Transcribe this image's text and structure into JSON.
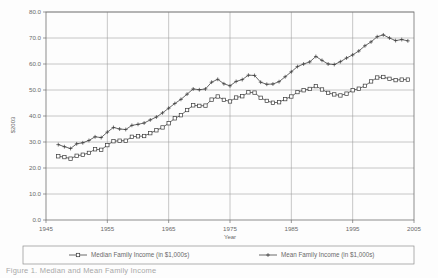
{
  "figure": {
    "name": "family-income-line-chart",
    "caption_fragment": "Figure 1. Median and Mean Family Income"
  },
  "axes": {
    "y_title": "$2003",
    "x_title": "Year",
    "y_ticks": [
      "0.0",
      "10.0",
      "20.0",
      "30.0",
      "40.0",
      "50.0",
      "60.0",
      "70.0",
      "80.0"
    ],
    "x_ticks": [
      "1945",
      "1955",
      "1965",
      "1975",
      "1985",
      "1995",
      "2005"
    ]
  },
  "legend": {
    "position": "bottom",
    "entries": [
      {
        "label": "Median Family Income (in $1,000s)",
        "marker": "square-marker"
      },
      {
        "label": "Mean Family Income (in $1,000s)",
        "marker": "plus-marker"
      }
    ]
  },
  "chart_data": {
    "type": "line",
    "title": "",
    "xlabel": "Year",
    "ylabel": "$2003",
    "xlim": [
      1945,
      2005
    ],
    "ylim": [
      0,
      80
    ],
    "xtick_step": 10,
    "ytick_step": 10,
    "grid": true,
    "legend_position": "bottom",
    "x": [
      1947,
      1948,
      1949,
      1950,
      1951,
      1952,
      1953,
      1954,
      1955,
      1956,
      1957,
      1958,
      1959,
      1960,
      1961,
      1962,
      1963,
      1964,
      1965,
      1966,
      1967,
      1968,
      1969,
      1970,
      1971,
      1972,
      1973,
      1974,
      1975,
      1976,
      1977,
      1978,
      1979,
      1980,
      1981,
      1982,
      1983,
      1984,
      1985,
      1986,
      1987,
      1988,
      1989,
      1990,
      1991,
      1992,
      1993,
      1994,
      1995,
      1996,
      1997,
      1998,
      1999,
      2000,
      2001,
      2002,
      2003,
      2004
    ],
    "series": [
      {
        "name": "Median Family Income (in $1,000s)",
        "marker": "square-marker",
        "values": [
          24.5,
          24.2,
          23.6,
          24.7,
          25.1,
          25.8,
          27.2,
          27.0,
          28.8,
          30.3,
          30.5,
          30.5,
          32.0,
          32.2,
          32.3,
          33.4,
          34.5,
          35.6,
          37.2,
          39.1,
          40.3,
          42.3,
          44.1,
          43.9,
          44.0,
          46.3,
          47.5,
          46.2,
          45.6,
          47.1,
          47.6,
          49.1,
          49.0,
          47.0,
          45.8,
          45.1,
          45.3,
          46.5,
          47.5,
          49.2,
          49.9,
          50.4,
          51.5,
          50.2,
          48.9,
          48.3,
          47.9,
          48.6,
          49.9,
          50.5,
          51.6,
          53.3,
          54.8,
          55.0,
          54.3,
          53.8,
          54.0,
          54.0
        ]
      },
      {
        "name": "Mean Family Income (in $1,000s)",
        "marker": "plus-marker",
        "values": [
          29.0,
          28.2,
          27.5,
          29.3,
          29.7,
          30.6,
          32.0,
          31.7,
          33.8,
          35.6,
          35.0,
          34.8,
          36.4,
          36.8,
          37.3,
          38.5,
          39.6,
          41.2,
          43.0,
          44.8,
          46.4,
          48.4,
          50.4,
          50.1,
          50.4,
          53.0,
          54.1,
          52.4,
          51.6,
          53.3,
          54.0,
          55.7,
          55.6,
          53.0,
          52.2,
          52.3,
          53.2,
          55.1,
          57.0,
          59.0,
          60.0,
          60.8,
          62.9,
          61.4,
          60.0,
          59.8,
          60.9,
          62.3,
          63.5,
          65.0,
          67.0,
          68.5,
          70.5,
          71.2,
          70.0,
          69.0,
          69.4,
          68.9
        ]
      }
    ]
  }
}
